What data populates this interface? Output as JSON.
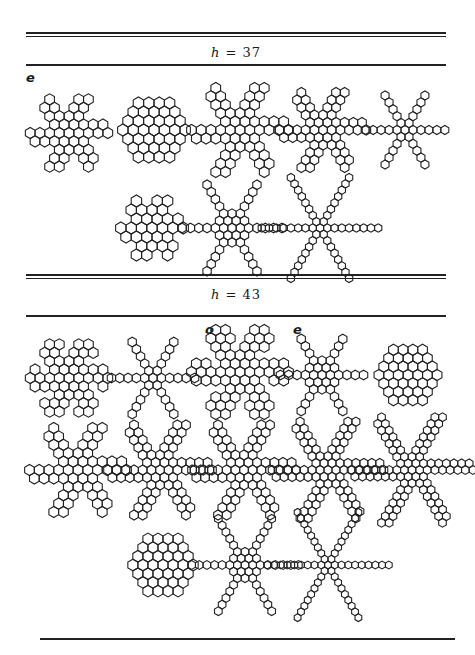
{
  "sections": [
    {
      "label_var": "h",
      "label_eq": " = ",
      "label_val": "37",
      "rules": {
        "top_double_y": 32,
        "label_y": 46,
        "bottom_y": 63
      },
      "label_top": 44
    },
    {
      "label_var": "h",
      "label_eq": " = ",
      "label_val": "43",
      "rules": {
        "top_double_y": 273,
        "label_y": 288,
        "bottom_y": 315
      },
      "label_top": 285
    }
  ],
  "marks": [
    {
      "text": "e",
      "x": 26,
      "y": 74
    },
    {
      "text": "o",
      "x": 205,
      "y": 328
    },
    {
      "text": "e",
      "x": 293,
      "y": 328
    }
  ],
  "footer_rule_y": 638,
  "figures": [
    {
      "cx": 69,
      "cy": 133,
      "s": 5.6,
      "type": "flake",
      "core": 2,
      "arm": 1,
      "armw": 2
    },
    {
      "cx": 154,
      "cy": 130,
      "s": 6.0,
      "type": "hexagon",
      "r": 3
    },
    {
      "cx": 240,
      "cy": 130,
      "s": 5.6,
      "type": "flake",
      "core": 2,
      "arm": 2,
      "armw": 2
    },
    {
      "cx": 323,
      "cy": 130,
      "s": 5.0,
      "type": "flake",
      "core": 1,
      "arm": 3,
      "armw": 2
    },
    {
      "cx": 405,
      "cy": 130,
      "s": 4.6,
      "type": "star",
      "core": 1,
      "arm": 4
    },
    {
      "cx": 152,
      "cy": 228,
      "s": 6.0,
      "type": "david",
      "r": 2
    },
    {
      "cx": 232,
      "cy": 228,
      "s": 4.8,
      "type": "star",
      "core": 2,
      "arm": 4
    },
    {
      "cx": 320,
      "cy": 228,
      "s": 4.2,
      "type": "star",
      "core": 1,
      "arm": 7
    },
    {
      "cx": 69,
      "cy": 378,
      "s": 5.6,
      "type": "flake",
      "core": 2,
      "arm": 1,
      "armw": 3
    },
    {
      "cx": 153,
      "cy": 378,
      "s": 4.8,
      "type": "flake",
      "core": 1,
      "arm": 4,
      "armw": 1
    },
    {
      "cx": 240,
      "cy": 372,
      "s": 5.6,
      "type": "flake",
      "core": 2,
      "arm": 2,
      "armw": 3
    },
    {
      "cx": 322,
      "cy": 375,
      "s": 4.8,
      "type": "flake",
      "core": 2,
      "arm": 3,
      "armw": 1
    },
    {
      "cx": 408,
      "cy": 375,
      "s": 5.6,
      "type": "hexagon",
      "r": 3
    },
    {
      "cx": 78,
      "cy": 470,
      "s": 5.6,
      "type": "flake",
      "core": 2,
      "arm": 2,
      "armw": 2
    },
    {
      "cx": 160,
      "cy": 470,
      "s": 5.0,
      "type": "flake",
      "core": 2,
      "arm": 3,
      "armw": 2
    },
    {
      "cx": 244,
      "cy": 470,
      "s": 5.0,
      "type": "flake",
      "core": 1,
      "arm": 4,
      "armw": 2
    },
    {
      "cx": 328,
      "cy": 470,
      "s": 4.6,
      "type": "flake",
      "core": 1,
      "arm": 5,
      "armw": 2
    },
    {
      "cx": 412,
      "cy": 470,
      "s": 4.4,
      "type": "flake",
      "core": 1,
      "arm": 6,
      "armw": 2
    },
    {
      "cx": 163,
      "cy": 565,
      "s": 5.8,
      "type": "hexagon",
      "r": 3
    },
    {
      "cx": 245,
      "cy": 565,
      "s": 4.4,
      "type": "star",
      "core": 2,
      "arm": 5
    },
    {
      "cx": 328,
      "cy": 565,
      "s": 3.9,
      "type": "star",
      "core": 1,
      "arm": 8
    }
  ]
}
